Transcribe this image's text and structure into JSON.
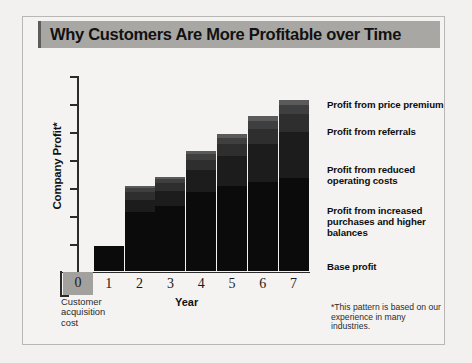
{
  "title": "Why Customers Are More Profitable over Time",
  "axes": {
    "y_label": "Company Profit*",
    "x_label": "Year",
    "x_ticks": [
      "0",
      "1",
      "2",
      "3",
      "4",
      "5",
      "6",
      "7"
    ],
    "zero_annotation": "Customer acquisition cost"
  },
  "footnote": "*This pattern is based on our experience in many industries.",
  "legend": [
    {
      "label": "Profit from price premium"
    },
    {
      "label": "Profit from referrals"
    },
    {
      "label": "Profit from reduced operating costs"
    },
    {
      "label": "Profit from increased purchases and higher balances"
    },
    {
      "label": "Base profit"
    }
  ],
  "colors": {
    "base_profit": "#0b0b0b",
    "increased_purchases": "#1c1c1c",
    "reduced_operating_costs": "#2e2e2e",
    "referrals": "#3f3f3f",
    "price_premium": "#5a5a5a",
    "acquisition_cost": "#a3a19e",
    "title_band": "#a9a7a4",
    "axis": "#2b2b2b"
  },
  "chart_data": {
    "type": "bar",
    "stacked": true,
    "title": "Why Customers Are More Profitable over Time",
    "xlabel": "Year",
    "ylabel": "Company Profit*",
    "categories": [
      "0",
      "1",
      "2",
      "3",
      "4",
      "5",
      "6",
      "7"
    ],
    "grid": false,
    "legend_position": "right",
    "ylim": [
      -25,
      180
    ],
    "note": "Year 0 is the customer acquisition cost, shown below the zero axis.",
    "series": [
      {
        "name": "Base profit",
        "values": [
          0,
          26,
          60,
          66,
          80,
          86,
          90,
          94
        ]
      },
      {
        "name": "Profit from increased purchases and higher balances",
        "values": [
          0,
          0,
          12,
          15,
          22,
          30,
          38,
          46
        ]
      },
      {
        "name": "Profit from reduced operating costs",
        "values": [
          0,
          0,
          8,
          8,
          10,
          12,
          15,
          18
        ]
      },
      {
        "name": "Profit from referrals",
        "values": [
          0,
          0,
          4,
          4,
          6,
          6,
          8,
          9
        ]
      },
      {
        "name": "Profit from price premium",
        "values": [
          0,
          0,
          2,
          2,
          3,
          4,
          5,
          6
        ]
      },
      {
        "name": "Customer acquisition cost",
        "values": [
          -23,
          0,
          0,
          0,
          0,
          0,
          0,
          0
        ]
      }
    ],
    "totals": [
      -23,
      26,
      86,
      95,
      121,
      138,
      156,
      173
    ]
  }
}
